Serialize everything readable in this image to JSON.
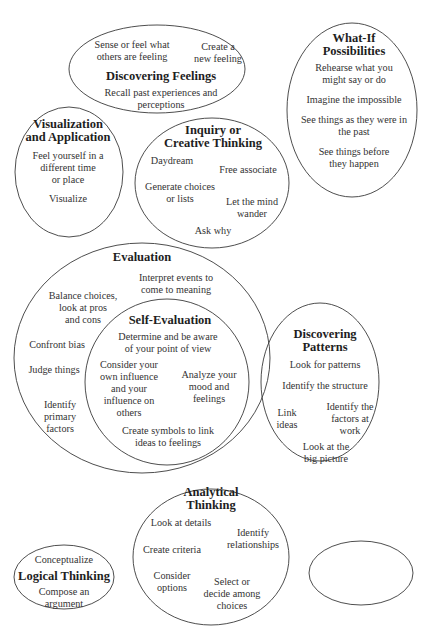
{
  "diagram": {
    "side_label": "Core Types of Thinking in History",
    "colors": {
      "stroke": "#3a3a3a",
      "text": "#333333",
      "title": "#1e1e1e",
      "background": "#ffffff"
    },
    "nodes": {
      "discovering_feelings": {
        "title": "Discovering Feelings",
        "items": [
          "Sense or feel what",
          "others are feeling",
          "Create a",
          "new feeling",
          "Recall past experiences and",
          "perceptions"
        ]
      },
      "what_if": {
        "title": [
          "What-If",
          "Possibilities"
        ],
        "items": [
          "Rehearse what you",
          "might say or do",
          "Imagine the impossible",
          "See things as they were in",
          "the past",
          "See things before",
          "they happen"
        ]
      },
      "visualization": {
        "title": [
          "Visualization",
          "and Application"
        ],
        "items": [
          "Feel yourself in a",
          "different time",
          "or place",
          "Visualize"
        ]
      },
      "inquiry": {
        "title": [
          "Inquiry or",
          "Creative Thinking"
        ],
        "items": [
          "Daydream",
          "Free associate",
          "Generate choices",
          "or lists",
          "Let the mind",
          "wander",
          "Ask why"
        ]
      },
      "evaluation": {
        "title": "Evaluation",
        "items": [
          "Interpret events to",
          "come to meaning",
          "Balance choices,",
          "look at pros",
          "and cons",
          "Confront bias",
          "Judge things",
          "Identify",
          "primary",
          "factors"
        ]
      },
      "self_evaluation": {
        "title": "Self-Evaluation",
        "items": [
          "Determine and be aware",
          "of your point of view",
          "Consider your",
          "own influence",
          "and your",
          "influence on",
          "others",
          "Analyze your",
          "mood and",
          "feelings",
          "Create symbols to link",
          "ideas to feelings"
        ]
      },
      "discovering_patterns": {
        "title": [
          "Discovering",
          "Patterns"
        ],
        "items": [
          "Look for patterns",
          "Identify the structure",
          "Link",
          "ideas",
          "Identify the",
          "factors at",
          "work",
          "Look at the",
          "big picture"
        ]
      },
      "analytical": {
        "title": [
          "Analytical",
          "Thinking"
        ],
        "items": [
          "Look at details",
          "Identify",
          "relationships",
          "Create criteria",
          "Consider",
          "options",
          "Select or",
          "decide among",
          "choices"
        ]
      },
      "logical": {
        "title": "Logical Thinking",
        "items": [
          "Conceptualize",
          "Compose an",
          "argument"
        ]
      },
      "synthesizing": {
        "title": "Synthesizing",
        "items": [
          "Create analogies",
          "Devise a framework for",
          "communicating ideas"
        ]
      }
    }
  }
}
